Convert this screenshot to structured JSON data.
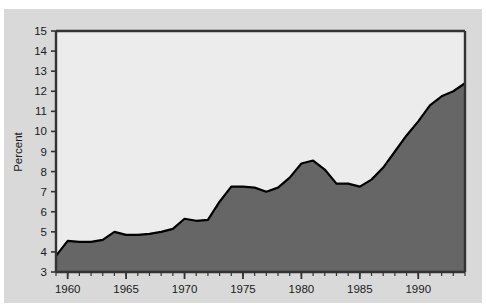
{
  "figure": {
    "title_partial": "",
    "background_color": "#d9d9d9",
    "plot_background_color": "#ececec",
    "fill_color": "#666666",
    "line_color": "#000000",
    "axis_color": "#333333"
  },
  "chart_data": {
    "type": "area",
    "title": "",
    "xlabel": "",
    "ylabel": "Percent",
    "xlim": [
      1959,
      1994
    ],
    "ylim": [
      3,
      15
    ],
    "grid": false,
    "legend": null,
    "y_ticks": [
      3,
      4,
      5,
      6,
      7,
      8,
      9,
      10,
      11,
      12,
      13,
      14,
      15
    ],
    "y_tick_labels": [
      "3",
      "4",
      "5",
      "6",
      "7",
      "8",
      "9",
      "10",
      "11",
      "12",
      "13",
      "14",
      "15"
    ],
    "x_ticks": [
      1960,
      1965,
      1970,
      1975,
      1980,
      1985,
      1990
    ],
    "x_tick_labels": [
      "1960",
      "1965",
      "1970",
      "1975",
      "1980",
      "1985",
      "1990"
    ],
    "x_minor_tick_step": 1,
    "x": [
      1959,
      1960,
      1961,
      1962,
      1963,
      1964,
      1965,
      1966,
      1967,
      1968,
      1969,
      1970,
      1971,
      1972,
      1973,
      1974,
      1975,
      1976,
      1977,
      1978,
      1979,
      1980,
      1981,
      1982,
      1983,
      1984,
      1985,
      1986,
      1987,
      1988,
      1989,
      1990,
      1991,
      1992,
      1993,
      1994
    ],
    "values": [
      3.8,
      4.55,
      4.5,
      4.5,
      4.6,
      5.0,
      4.85,
      4.85,
      4.9,
      5.0,
      5.15,
      5.65,
      5.55,
      5.6,
      6.5,
      7.25,
      7.25,
      7.2,
      7.0,
      7.2,
      7.7,
      8.4,
      8.55,
      8.1,
      7.4,
      7.4,
      7.25,
      7.6,
      8.2,
      9.0,
      9.8,
      10.5,
      11.3,
      11.75,
      12.0,
      12.4
    ],
    "series_name": "Percent"
  }
}
